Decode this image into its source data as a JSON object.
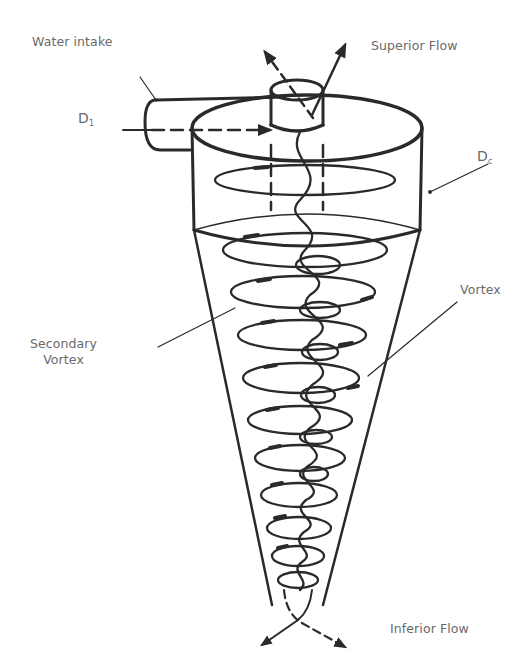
{
  "diagram": {
    "type": "hydrocyclone-flow-schematic",
    "stroke_color": "#2a2a2a",
    "label_color": "#6a6a6a",
    "background": "#ffffff"
  },
  "labels": {
    "water_intake": "Water intake",
    "superior_flow": "Superior Flow",
    "d1_main": "D",
    "d1_sub": "1",
    "dc_main": "D",
    "dc_sub": "c",
    "secondary_vortex_line1": "Secondary",
    "secondary_vortex_line2": "Vortex",
    "vortex": "Vortex",
    "inferior_flow": "Inferior Flow"
  }
}
